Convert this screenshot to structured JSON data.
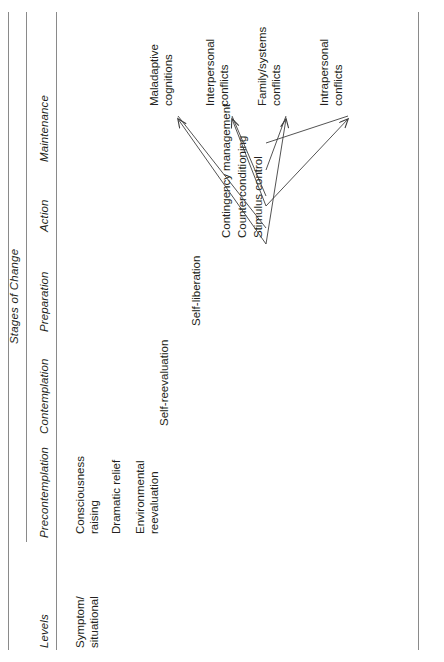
{
  "figure": {
    "super_header": "Stages of Change",
    "row_header": "Levels",
    "stages": [
      "Precontemplation",
      "Contemplation",
      "Preparation",
      "Action",
      "Maintenance"
    ],
    "levels_column_label": "Levels",
    "row_label": "Symptom/\nsituational",
    "processes": [
      {
        "id": "consciousness-raising",
        "text": "Consciousness\nraising",
        "stage": "Precontemplation"
      },
      {
        "id": "dramatic-relief",
        "text": "Dramatic relief",
        "stage": "Precontemplation"
      },
      {
        "id": "environmental-reevaluation",
        "text": "Environmental\nreevaluation",
        "stage": "Precontemplation"
      },
      {
        "id": "self-reevaluation",
        "text": "Self-reevaluation",
        "stage": "Contemplation"
      },
      {
        "id": "self-liberation",
        "text": "Self-liberation",
        "stage": "Preparation"
      },
      {
        "id": "contingency-management",
        "text": "Contingency management",
        "stage": "Action"
      },
      {
        "id": "counterconditioning",
        "text": "Counterconditioning",
        "stage": "Action"
      },
      {
        "id": "stimulus-control",
        "text": "Stimulus control",
        "stage": "Action"
      }
    ],
    "targets": [
      {
        "id": "maladaptive-cognitions",
        "text": "Maladaptive\ncognitions"
      },
      {
        "id": "interpersonal-conflicts",
        "text": "Interpersonal\nconflicts"
      },
      {
        "id": "family-systems-conflicts",
        "text": "Family/systems\nconflicts"
      },
      {
        "id": "intrapersonal-conflicts",
        "text": "Intrapersonal\nconflicts"
      }
    ],
    "colors": {
      "rule": "#8a8a8a",
      "text": "#231f20",
      "arrow": "#3f3f3f"
    }
  }
}
